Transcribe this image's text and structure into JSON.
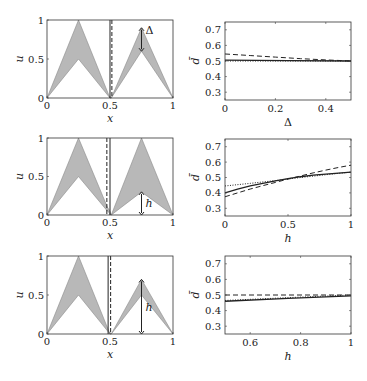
{
  "chart_data": [
    {
      "type": "area",
      "panel": "row1-left",
      "xlabel": "x",
      "ylabel": "u",
      "xlim": [
        0,
        1
      ],
      "ylim": [
        0,
        1
      ],
      "xticks": [
        "0",
        "0.5",
        "1"
      ],
      "yticks": [
        "0",
        "0.5",
        "1"
      ],
      "fill_color": "#b8b8b8",
      "upper": {
        "x": [
          0,
          0.25,
          0.5,
          0.51,
          0.75,
          1
        ],
        "y": [
          0,
          1,
          0,
          0,
          0.9,
          0
        ]
      },
      "lower": {
        "x": [
          0,
          0.25,
          0.5,
          0.51,
          0.75,
          1
        ],
        "y": [
          0,
          0.5,
          0,
          0,
          0.6,
          0
        ]
      },
      "vlines": [
        {
          "x": 0.5,
          "style": "solid"
        },
        {
          "x": 0.515,
          "style": "dashed"
        }
      ],
      "annotation": {
        "label": "Δ",
        "x": 0.75,
        "from": 0.9,
        "to": 0.6
      }
    },
    {
      "type": "line",
      "panel": "row1-right",
      "xlabel": "Δ",
      "ylabel": "d̄",
      "xlim": [
        0,
        0.5
      ],
      "ylim": [
        0.25,
        0.75
      ],
      "xticks": [
        "0",
        "0.2",
        "0.4"
      ],
      "yticks": [
        "0.3",
        "0.4",
        "0.5",
        "0.6",
        "0.7"
      ],
      "xtick_values": [
        0,
        0.2,
        0.4
      ],
      "ytick_values": [
        0.3,
        0.4,
        0.5,
        0.6,
        0.7
      ],
      "series": [
        {
          "name": "solid",
          "style": "solid",
          "x": [
            0,
            0.25,
            0.5
          ],
          "y": [
            0.505,
            0.503,
            0.5
          ]
        },
        {
          "name": "dashed",
          "style": "dashed",
          "x": [
            0,
            0.1,
            0.2,
            0.3,
            0.4,
            0.5
          ],
          "y": [
            0.545,
            0.535,
            0.525,
            0.515,
            0.507,
            0.5
          ]
        },
        {
          "name": "dotted",
          "style": "dotted",
          "x": [
            0,
            0.25,
            0.5
          ],
          "y": [
            0.5,
            0.5,
            0.5
          ]
        }
      ]
    },
    {
      "type": "area",
      "panel": "row2-left",
      "xlabel": "x",
      "ylabel": "u",
      "xlim": [
        0,
        1
      ],
      "ylim": [
        0,
        1
      ],
      "xticks": [
        "0",
        "0.5",
        "1"
      ],
      "yticks": [
        "0",
        "0.5",
        "1"
      ],
      "fill_color": "#b8b8b8",
      "upper": {
        "x": [
          0,
          0.25,
          0.48,
          0.5,
          0.51,
          0.75,
          1
        ],
        "y": [
          0,
          1,
          0.1,
          0.05,
          0,
          1,
          0
        ]
      },
      "lower": {
        "x": [
          0,
          0.25,
          0.48,
          0.5,
          0.51,
          0.75,
          1
        ],
        "y": [
          0,
          0.5,
          0.05,
          0.02,
          0,
          0.3,
          0
        ]
      },
      "vlines": [
        {
          "x": 0.5,
          "style": "solid"
        },
        {
          "x": 0.475,
          "style": "dashed"
        }
      ],
      "annotation": {
        "label": "h",
        "x": 0.75,
        "from": 0.3,
        "to": 0
      }
    },
    {
      "type": "line",
      "panel": "row2-right",
      "xlabel": "h",
      "ylabel": "d̄",
      "xlim": [
        0,
        1
      ],
      "ylim": [
        0.25,
        0.75
      ],
      "xticks": [
        "0",
        "0.5",
        "1"
      ],
      "yticks": [
        "0.3",
        "0.4",
        "0.5",
        "0.6",
        "0.7"
      ],
      "xtick_values": [
        0,
        0.5,
        1
      ],
      "ytick_values": [
        0.3,
        0.4,
        0.5,
        0.6,
        0.7
      ],
      "series": [
        {
          "name": "solid",
          "style": "solid",
          "x": [
            0,
            0.1,
            0.2,
            0.3,
            0.4,
            0.5,
            0.6,
            0.7,
            0.8,
            0.9,
            1
          ],
          "y": [
            0.4,
            0.425,
            0.445,
            0.462,
            0.478,
            0.492,
            0.505,
            0.515,
            0.522,
            0.528,
            0.535
          ]
        },
        {
          "name": "dashed",
          "style": "dashed",
          "x": [
            0,
            0.1,
            0.2,
            0.3,
            0.4,
            0.5,
            0.6,
            0.7,
            0.8,
            0.9,
            1
          ],
          "y": [
            0.375,
            0.4,
            0.425,
            0.447,
            0.468,
            0.49,
            0.51,
            0.53,
            0.548,
            0.565,
            0.58
          ]
        },
        {
          "name": "dotted",
          "style": "dotted",
          "x": [
            0,
            0.2,
            0.4,
            0.6,
            0.8,
            1
          ],
          "y": [
            0.445,
            0.462,
            0.48,
            0.5,
            0.518,
            0.535
          ]
        }
      ]
    },
    {
      "type": "area",
      "panel": "row3-left",
      "xlabel": "x",
      "ylabel": "u",
      "xlim": [
        0,
        1
      ],
      "ylim": [
        0,
        1
      ],
      "xticks": [
        "0",
        "0.5",
        "1"
      ],
      "yticks": [
        "0",
        "0.5",
        "1"
      ],
      "fill_color": "#b8b8b8",
      "upper": {
        "x": [
          0,
          0.25,
          0.5,
          0.51,
          0.75,
          1
        ],
        "y": [
          0,
          1,
          0,
          0,
          0.7,
          0
        ]
      },
      "lower": {
        "x": [
          0,
          0.25,
          0.5,
          0.51,
          0.75,
          1
        ],
        "y": [
          0,
          0.5,
          0,
          0,
          0.5,
          0
        ]
      },
      "vlines": [
        {
          "x": 0.485,
          "style": "solid"
        },
        {
          "x": 0.505,
          "style": "dashed"
        }
      ],
      "annotation": {
        "label": "h",
        "x": 0.75,
        "from": 0.7,
        "to": 0
      }
    },
    {
      "type": "line",
      "panel": "row3-right",
      "xlabel": "h",
      "ylabel": "d̄",
      "xlim": [
        0.5,
        1
      ],
      "ylim": [
        0.25,
        0.75
      ],
      "xticks": [
        "0.6",
        "0.8",
        "1"
      ],
      "yticks": [
        "0.3",
        "0.4",
        "0.5",
        "0.6",
        "0.7"
      ],
      "xtick_values": [
        0.6,
        0.8,
        1
      ],
      "ytick_values": [
        0.3,
        0.4,
        0.5,
        0.6,
        0.7
      ],
      "series": [
        {
          "name": "solid",
          "style": "solid",
          "x": [
            0.5,
            0.75,
            1
          ],
          "y": [
            0.46,
            0.478,
            0.495
          ]
        },
        {
          "name": "dashed",
          "style": "dashed",
          "x": [
            0.5,
            0.75,
            1
          ],
          "y": [
            0.5,
            0.5,
            0.5
          ]
        },
        {
          "name": "dotted",
          "style": "dotted",
          "x": [
            0.5,
            0.75,
            1
          ],
          "y": [
            0.465,
            0.483,
            0.5
          ]
        }
      ]
    }
  ]
}
